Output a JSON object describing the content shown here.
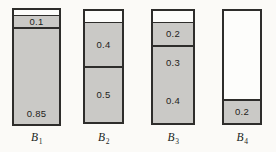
{
  "figure": {
    "bars": [
      {
        "name": "B",
        "sub": "1",
        "unshaded_top": 0.05,
        "segments": [
          {
            "label": "0.1",
            "value": 0.1,
            "label_pos": "center",
            "divider_below": true
          },
          {
            "label": "0.85",
            "value": 0.85,
            "label_pos": "bottom",
            "divider_below": false
          }
        ]
      },
      {
        "name": "B",
        "sub": "2",
        "unshaded_top": 0.1,
        "segments": [
          {
            "label": "0.4",
            "value": 0.4,
            "label_pos": "center",
            "divider_below": true
          },
          {
            "label": "0.5",
            "value": 0.5,
            "label_pos": "center",
            "divider_below": false
          }
        ]
      },
      {
        "name": "B",
        "sub": "3",
        "unshaded_top": 0.1,
        "segments": [
          {
            "label": "0.2",
            "value": 0.2,
            "label_pos": "center",
            "divider_below": true
          },
          {
            "label": "0.3",
            "value": 0.3,
            "label_pos": "center",
            "divider_below": false
          },
          {
            "label": "0.4",
            "value": 0.4,
            "label_pos": "center",
            "divider_below": false
          }
        ]
      },
      {
        "name": "B",
        "sub": "4",
        "unshaded_top": 0.8,
        "segments": [
          {
            "label": "0.2",
            "value": 0.2,
            "label_pos": "center",
            "divider_below": false
          }
        ]
      }
    ],
    "colors": {
      "shaded_fill": "#cac9c6",
      "unshaded_fill": "#fdfdfb",
      "border": "#2e2d2b",
      "text": "#1e1d1b",
      "background": "#fbfaf7"
    }
  },
  "chart_data": {
    "type": "bar",
    "subtype": "stacked-proportion",
    "title": "",
    "xlabel": "",
    "ylabel": "",
    "ylim": [
      0,
      1
    ],
    "categories": [
      "B1",
      "B2",
      "B3",
      "B4"
    ],
    "segments_per_bar": [
      [
        0.1,
        0.85
      ],
      [
        0.4,
        0.5
      ],
      [
        0.2,
        0.3,
        0.4
      ],
      [
        0.2
      ]
    ],
    "unshaded_remainder_top": [
      0.05,
      0.1,
      0.1,
      0.8
    ],
    "segment_labels": [
      [
        "0.1",
        "0.85"
      ],
      [
        "0.4",
        "0.5"
      ],
      [
        "0.2",
        "0.3",
        "0.4"
      ],
      [
        "0.2"
      ]
    ],
    "grid": false,
    "legend": false,
    "axes_shown": false
  }
}
